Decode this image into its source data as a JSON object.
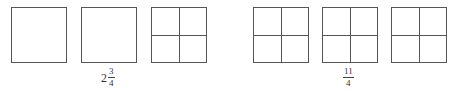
{
  "groups": [
    {
      "name": "mixed-number-group",
      "boxes": [
        {
          "left": 11,
          "top": 7,
          "divided": false
        },
        {
          "left": 81,
          "top": 7,
          "divided": false
        },
        {
          "left": 151,
          "top": 7,
          "divided": true
        }
      ],
      "label": {
        "whole": "2",
        "numerator": "3",
        "denominator": "4",
        "text": "2 3/4"
      }
    },
    {
      "name": "improper-fraction-group",
      "boxes": [
        {
          "left": 253,
          "top": 7,
          "divided": true
        },
        {
          "left": 322,
          "top": 7,
          "divided": true
        },
        {
          "left": 391,
          "top": 7,
          "divided": true
        }
      ],
      "label": {
        "numerator": "11",
        "denominator": "4",
        "text": "11/4"
      }
    }
  ],
  "colors": {
    "line": "#555555",
    "text": "#333333",
    "background": "#ffffff"
  }
}
